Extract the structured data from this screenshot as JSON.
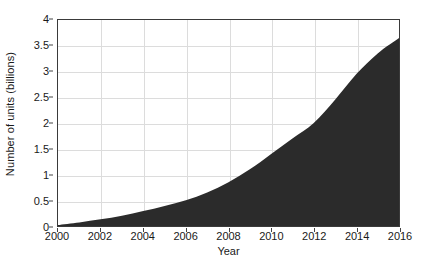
{
  "chart_data": {
    "type": "area",
    "title": "",
    "subtitle": "",
    "xlabel": "Year",
    "ylabel": "Number of units (billions)",
    "xlim": [
      2000,
      2016
    ],
    "ylim": [
      0,
      4
    ],
    "grid": true,
    "legend": null,
    "legend_position": "none",
    "series_color": "#2b2b2b",
    "grid_color": "#dcdcdc",
    "axis_color": "#3a3a3a",
    "background_color": "#ffffff",
    "x_ticks": [
      "2000",
      "2002",
      "2004",
      "2006",
      "2008",
      "2010",
      "2012",
      "2014",
      "2016"
    ],
    "x_tick_values": [
      2000,
      2002,
      2004,
      2006,
      2008,
      2010,
      2012,
      2014,
      2016
    ],
    "y_ticks": [
      "4",
      "3.5",
      "3",
      "2.5",
      "2",
      "1.5",
      "1",
      "0.5",
      "0"
    ],
    "y_tick_values": [
      4,
      3.5,
      3,
      2.5,
      2,
      1.5,
      1,
      0.5,
      0
    ],
    "x": [
      2000,
      2001,
      2002,
      2003,
      2004,
      2005,
      2006,
      2007,
      2008,
      2009,
      2010,
      2011,
      2012,
      2013,
      2014,
      2015,
      2016
    ],
    "values": [
      0.02,
      0.07,
      0.13,
      0.2,
      0.29,
      0.39,
      0.5,
      0.65,
      0.85,
      1.1,
      1.4,
      1.7,
      2.0,
      2.45,
      2.95,
      3.35,
      3.65
    ],
    "series": [
      {
        "name": "Number of units",
        "values": [
          0.02,
          0.07,
          0.13,
          0.2,
          0.29,
          0.39,
          0.5,
          0.65,
          0.85,
          1.1,
          1.4,
          1.7,
          2.0,
          2.45,
          2.95,
          3.35,
          3.65
        ]
      }
    ]
  }
}
